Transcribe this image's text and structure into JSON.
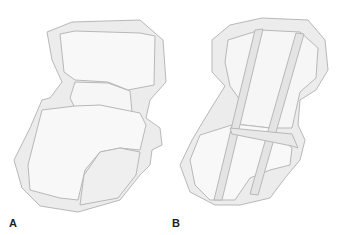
{
  "figure": {
    "panels": [
      {
        "id": "A",
        "label": "A"
      },
      {
        "id": "B",
        "label": "B"
      }
    ],
    "colors": {
      "background": "#ffffff",
      "outline": "#b8b8b8",
      "capsule_fill": "#ececec",
      "bone_fill": "#f8f8f8",
      "strip_fill": "#e4e4e4",
      "label": "#222222"
    }
  }
}
